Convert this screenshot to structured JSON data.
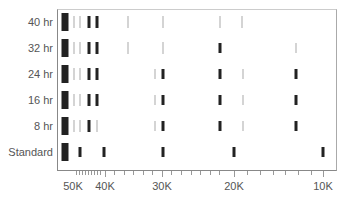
{
  "chart_data": {
    "type": "scatter",
    "title": "",
    "xlabel": "",
    "ylabel": "",
    "x_scale": "reciprocal",
    "x_tick_labels": [
      {
        "label": "50K",
        "px": 73
      },
      {
        "label": "40K",
        "px": 105
      },
      {
        "label": "30K",
        "px": 162
      },
      {
        "label": "20K",
        "px": 234
      },
      {
        "label": "10K",
        "px": 323
      }
    ],
    "categories": [
      "40 hr",
      "32 hr",
      "24 hr",
      "16 hr",
      "8 hr",
      "Standard"
    ],
    "row_y": [
      22,
      48,
      74,
      100,
      126,
      152
    ],
    "series": [
      {
        "name": "40 hr",
        "marks": [
          {
            "x": 65,
            "w": 7,
            "h": 18,
            "tone": "dark"
          },
          {
            "x": 74,
            "w": 1,
            "h": 12,
            "tone": "light"
          },
          {
            "x": 80,
            "w": 1,
            "h": 12,
            "tone": "light"
          },
          {
            "x": 89,
            "w": 3,
            "h": 12,
            "tone": "dark"
          },
          {
            "x": 97,
            "w": 3,
            "h": 12,
            "tone": "dark"
          },
          {
            "x": 128,
            "w": 1,
            "h": 12,
            "tone": "light"
          },
          {
            "x": 163,
            "w": 1,
            "h": 12,
            "tone": "light"
          },
          {
            "x": 220,
            "w": 1,
            "h": 12,
            "tone": "light"
          },
          {
            "x": 242,
            "w": 1,
            "h": 12,
            "tone": "light"
          }
        ]
      },
      {
        "name": "32 hr",
        "marks": [
          {
            "x": 65,
            "w": 7,
            "h": 18,
            "tone": "dark"
          },
          {
            "x": 74,
            "w": 1,
            "h": 12,
            "tone": "light"
          },
          {
            "x": 80,
            "w": 1,
            "h": 12,
            "tone": "light"
          },
          {
            "x": 89,
            "w": 3,
            "h": 12,
            "tone": "dark"
          },
          {
            "x": 97,
            "w": 3,
            "h": 12,
            "tone": "dark"
          },
          {
            "x": 128,
            "w": 1,
            "h": 12,
            "tone": "light"
          },
          {
            "x": 163,
            "w": 1,
            "h": 12,
            "tone": "light"
          },
          {
            "x": 220,
            "w": 3,
            "h": 10,
            "tone": "dark"
          },
          {
            "x": 296,
            "w": 1,
            "h": 10,
            "tone": "light"
          }
        ]
      },
      {
        "name": "24 hr",
        "marks": [
          {
            "x": 65,
            "w": 7,
            "h": 18,
            "tone": "dark"
          },
          {
            "x": 74,
            "w": 1,
            "h": 12,
            "tone": "light"
          },
          {
            "x": 80,
            "w": 1,
            "h": 12,
            "tone": "light"
          },
          {
            "x": 89,
            "w": 3,
            "h": 12,
            "tone": "dark"
          },
          {
            "x": 97,
            "w": 3,
            "h": 12,
            "tone": "dark"
          },
          {
            "x": 155,
            "w": 1,
            "h": 10,
            "tone": "light"
          },
          {
            "x": 163,
            "w": 3,
            "h": 10,
            "tone": "dark"
          },
          {
            "x": 220,
            "w": 3,
            "h": 10,
            "tone": "dark"
          },
          {
            "x": 243,
            "w": 1,
            "h": 10,
            "tone": "light"
          },
          {
            "x": 296,
            "w": 3,
            "h": 10,
            "tone": "dark"
          }
        ]
      },
      {
        "name": "16 hr",
        "marks": [
          {
            "x": 65,
            "w": 7,
            "h": 18,
            "tone": "dark"
          },
          {
            "x": 74,
            "w": 1,
            "h": 12,
            "tone": "light"
          },
          {
            "x": 80,
            "w": 1,
            "h": 12,
            "tone": "light"
          },
          {
            "x": 89,
            "w": 3,
            "h": 12,
            "tone": "dark"
          },
          {
            "x": 97,
            "w": 3,
            "h": 12,
            "tone": "dark"
          },
          {
            "x": 155,
            "w": 1,
            "h": 10,
            "tone": "light"
          },
          {
            "x": 163,
            "w": 3,
            "h": 10,
            "tone": "dark"
          },
          {
            "x": 220,
            "w": 3,
            "h": 10,
            "tone": "dark"
          },
          {
            "x": 243,
            "w": 1,
            "h": 10,
            "tone": "light"
          },
          {
            "x": 296,
            "w": 3,
            "h": 10,
            "tone": "dark"
          }
        ]
      },
      {
        "name": "8 hr",
        "marks": [
          {
            "x": 65,
            "w": 7,
            "h": 18,
            "tone": "dark"
          },
          {
            "x": 74,
            "w": 1,
            "h": 12,
            "tone": "light"
          },
          {
            "x": 80,
            "w": 1,
            "h": 12,
            "tone": "light"
          },
          {
            "x": 89,
            "w": 3,
            "h": 12,
            "tone": "dark"
          },
          {
            "x": 97,
            "w": 1,
            "h": 12,
            "tone": "light"
          },
          {
            "x": 155,
            "w": 1,
            "h": 10,
            "tone": "light"
          },
          {
            "x": 163,
            "w": 3,
            "h": 10,
            "tone": "dark"
          },
          {
            "x": 220,
            "w": 3,
            "h": 10,
            "tone": "dark"
          },
          {
            "x": 243,
            "w": 1,
            "h": 10,
            "tone": "light"
          },
          {
            "x": 296,
            "w": 3,
            "h": 10,
            "tone": "dark"
          }
        ]
      },
      {
        "name": "Standard",
        "marks": [
          {
            "x": 65,
            "w": 7,
            "h": 18,
            "tone": "dark"
          },
          {
            "x": 80,
            "w": 3,
            "h": 10,
            "tone": "dark"
          },
          {
            "x": 104,
            "w": 3,
            "h": 10,
            "tone": "dark"
          },
          {
            "x": 163,
            "w": 3,
            "h": 10,
            "tone": "dark"
          },
          {
            "x": 234,
            "w": 3,
            "h": 10,
            "tone": "dark"
          },
          {
            "x": 323,
            "w": 3,
            "h": 10,
            "tone": "dark"
          }
        ]
      }
    ],
    "minor_ticks_px": [
      76,
      79,
      82,
      85,
      88,
      91,
      94,
      97,
      100,
      105,
      114,
      124,
      133,
      143,
      152,
      162,
      171,
      181,
      191,
      200,
      210,
      219,
      234,
      247,
      260,
      273,
      285,
      298,
      311,
      323
    ],
    "major_ticks_px": [
      105,
      162,
      234,
      323
    ],
    "grid": false,
    "legend": "none"
  },
  "colors": {
    "dark": "#222222",
    "light": "#aaaaaa",
    "axis": "#888888",
    "text": "#555555"
  }
}
